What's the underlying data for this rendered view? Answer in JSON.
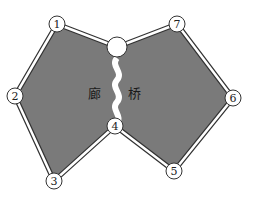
{
  "diagram": {
    "type": "graph-with-regions",
    "colors": {
      "region_fill": "#7a7a7a",
      "edge_outer": "#333333",
      "edge_inner": "#ffffff",
      "node_fill": "#ffffff",
      "node_stroke": "#333333"
    },
    "nodes": [
      {
        "id": "1",
        "label": "1",
        "x": 57,
        "y": 24
      },
      {
        "id": "2",
        "label": "2",
        "x": 15,
        "y": 96
      },
      {
        "id": "3",
        "label": "3",
        "x": 54,
        "y": 181
      },
      {
        "id": "4",
        "label": "4",
        "x": 115,
        "y": 126
      },
      {
        "id": "5",
        "label": "5",
        "x": 174,
        "y": 171
      },
      {
        "id": "6",
        "label": "6",
        "x": 233,
        "y": 98
      },
      {
        "id": "7",
        "label": "7",
        "x": 177,
        "y": 24
      },
      {
        "id": "top",
        "label": "",
        "x": 117,
        "y": 47
      }
    ],
    "edges": [
      [
        "1",
        "top"
      ],
      [
        "top",
        "7"
      ],
      [
        "7",
        "6"
      ],
      [
        "6",
        "5"
      ],
      [
        "5",
        "4"
      ],
      [
        "4",
        "3"
      ],
      [
        "3",
        "2"
      ],
      [
        "2",
        "1"
      ],
      [
        "top",
        "4"
      ]
    ],
    "region_labels": {
      "left": "廊",
      "right": "桥"
    }
  }
}
